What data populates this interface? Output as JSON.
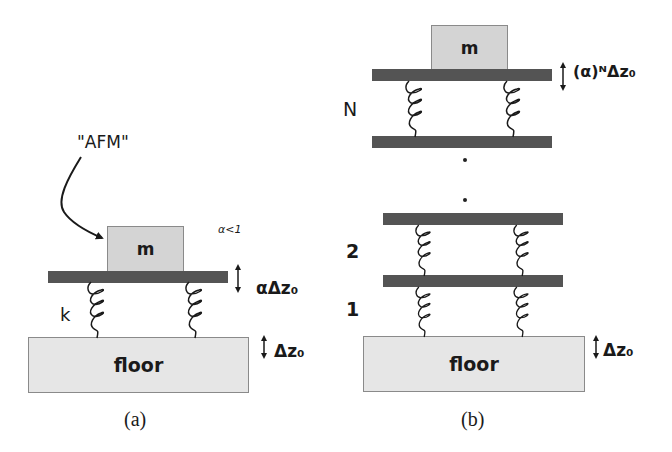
{
  "panel_a": {
    "afm_label": "\"AFM\"",
    "alpha_condition": "α<1",
    "mass_label": "m",
    "spring_label": "k",
    "plate_displacement": "αΔz₀",
    "floor_label": "floor",
    "floor_displacement": "Δz₀",
    "caption": "(a)"
  },
  "panel_b": {
    "mass_label": "m",
    "top_displacement": "(α)ᴺΔz₀",
    "stage_labels": [
      "N",
      "2",
      "1"
    ],
    "floor_label": "floor",
    "floor_displacement": "Δz₀",
    "caption": "(b)"
  },
  "colors": {
    "plate": "#545454",
    "mass": "#d4d4d4",
    "floor": "#e6e6e6",
    "line": "#1a1a1a"
  }
}
